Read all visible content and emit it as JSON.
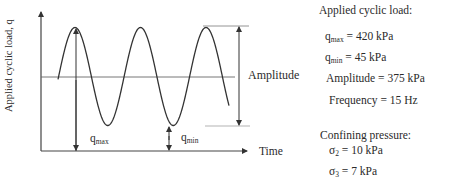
{
  "diagram": {
    "y_axis_label": "Applied cyclic load, q",
    "x_axis_label": "Time",
    "amplitude_label": "Amplitude",
    "qmax_label": {
      "base": "q",
      "sub": "max"
    },
    "qmin_label": {
      "base": "q",
      "sub": "min"
    },
    "wave": {
      "cycles_shown": 3,
      "type": "sinusoidal"
    }
  },
  "parameters": {
    "load_heading": "Applied cyclic load:",
    "qmax": {
      "base": "q",
      "sub": "max",
      "text": " = 420 kPa"
    },
    "qmin": {
      "base": "q",
      "sub": "min",
      "text": " = 45 kPa"
    },
    "amplitude": "Amplitude = 375 kPa",
    "frequency": "Frequency = 15 Hz",
    "confining_heading": "Confining pressure:",
    "sigma2": {
      "base": "σ",
      "sub": "2",
      "text": " = 10 kPa"
    },
    "sigma3": {
      "base": "σ",
      "sub": "3",
      "text": " = 7 kPa"
    }
  }
}
